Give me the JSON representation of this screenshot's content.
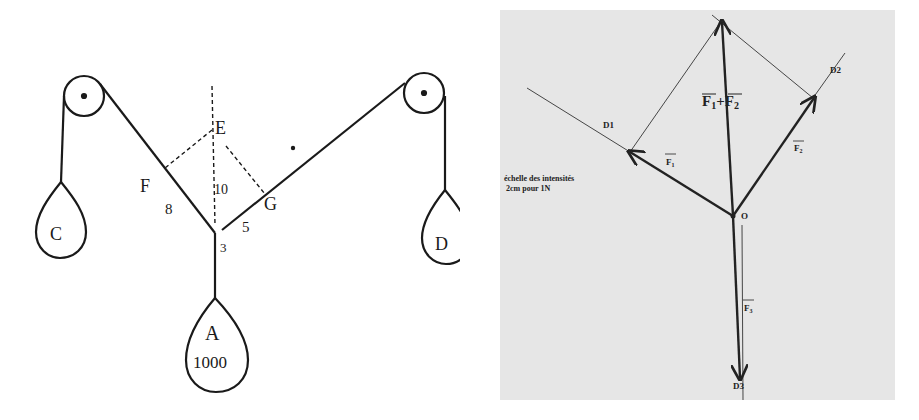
{
  "left_diagram": {
    "labels": {
      "E": "E",
      "F": "F",
      "G": "G",
      "angle_left": "8",
      "angle_right": "5",
      "center_value": "10",
      "junction_mark": "3"
    },
    "weights": {
      "C": "C",
      "D": "D",
      "A": "A",
      "A_value": "1000"
    }
  },
  "right_diagram": {
    "colors": {
      "background": "#e6e6e6",
      "line": "#222222"
    },
    "labels": {
      "D1": "D1",
      "D2": "D2",
      "D3": "D3",
      "O": "O",
      "sum": "F",
      "sum_sub1": "1",
      "sum_plus": "+F",
      "sum_sub2": "2",
      "F1": "F",
      "F1_sub": "1",
      "F2": "F",
      "F2_sub": "2",
      "F3": "F",
      "F3_sub": "3"
    },
    "scale": {
      "line1": "échelle des intensités",
      "line2": "2cm pour 1N"
    }
  }
}
